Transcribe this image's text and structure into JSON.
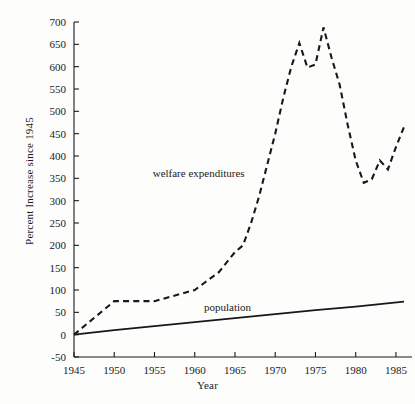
{
  "chart_data": {
    "type": "line",
    "title": "",
    "xlabel": "Year",
    "ylabel": "Percent Increase since 1945",
    "xlim": [
      1945,
      1986
    ],
    "ylim": [
      -50,
      700
    ],
    "xticks": [
      1945,
      1950,
      1955,
      1960,
      1965,
      1970,
      1975,
      1980,
      1985
    ],
    "xtick_labels": [
      "1945",
      "1950",
      "1955",
      "1960",
      "1965",
      "1970",
      "1975",
      "1980",
      "1985"
    ],
    "yticks": [
      -50,
      0,
      50,
      100,
      150,
      200,
      250,
      300,
      350,
      400,
      450,
      500,
      550,
      600,
      650,
      700
    ],
    "ytick_labels": [
      "-50",
      "0",
      "50",
      "100",
      "150",
      "200",
      "250",
      "300",
      "350",
      "400",
      "450",
      "500",
      "550",
      "600",
      "650",
      "700"
    ],
    "grid": false,
    "legend": "inline-annotations",
    "annotations": [
      {
        "text": "welfare expenditures",
        "x": 1966.2,
        "y": 352
      },
      {
        "text": "population",
        "x": 1967.0,
        "y": 52
      }
    ],
    "series": [
      {
        "name": "welfare expenditures",
        "style": "dashed",
        "x": [
          1945,
          1950,
          1955,
          1960,
          1963,
          1965,
          1966,
          1967,
          1968,
          1969,
          1970,
          1971,
          1972,
          1973,
          1974,
          1975,
          1976,
          1977,
          1978,
          1979,
          1980,
          1981,
          1982,
          1983,
          1984,
          1985,
          1986
        ],
        "y": [
          0,
          75,
          75,
          100,
          140,
          185,
          200,
          250,
          310,
          380,
          450,
          530,
          600,
          653,
          598,
          605,
          688,
          620,
          560,
          470,
          390,
          340,
          348,
          390,
          370,
          420,
          465
        ]
      },
      {
        "name": "population",
        "style": "solid",
        "x": [
          1945,
          1950,
          1955,
          1960,
          1965,
          1970,
          1975,
          1980,
          1986
        ],
        "y": [
          0,
          10,
          19,
          28,
          37,
          46,
          55,
          63,
          74
        ]
      }
    ]
  },
  "axes": {
    "y_title": "Percent Increase since 1945",
    "x_title": "Year"
  }
}
